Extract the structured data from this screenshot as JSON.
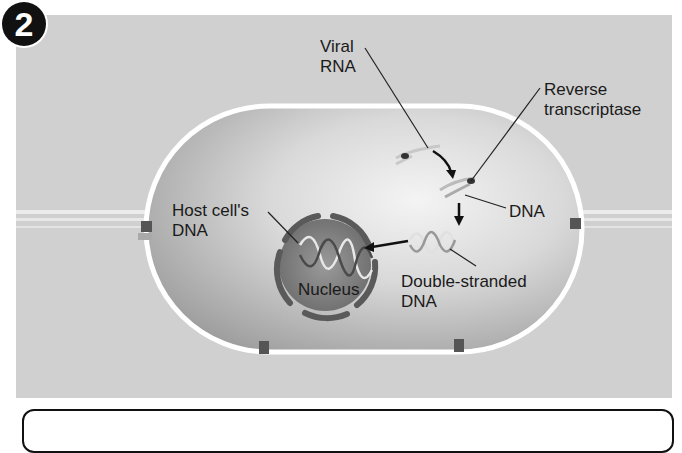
{
  "step": {
    "number": "2"
  },
  "labels": {
    "viral_rna": [
      "Viral",
      "RNA"
    ],
    "reverse_transcriptase": [
      "Reverse",
      "transcriptase"
    ],
    "dna": "DNA",
    "host_cell_dna": [
      "Host cell's",
      "DNA"
    ],
    "nucleus": "Nucleus",
    "double_stranded_dna": [
      "Double-stranded",
      "DNA"
    ]
  },
  "colors": {
    "background": "#d0d0d0",
    "cell_interior": "#b8b8b8",
    "membrane": "#ffffff",
    "nucleus_envelope": "#6e6e6e",
    "badge": "#111111",
    "text": "#1a1a1a"
  }
}
